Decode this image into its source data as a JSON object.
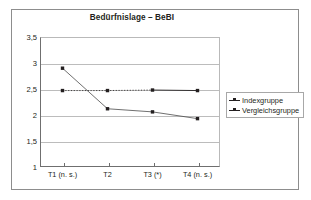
{
  "chart_data": {
    "type": "line",
    "title": "Bedürfnislage – BeBI",
    "xlabel": "",
    "ylabel": "",
    "categories": [
      "T1 (n. s.)",
      "T2",
      "T3 (*)",
      "T4 (n. s.)"
    ],
    "ylim": [
      1,
      3.5
    ],
    "yticks": [
      "1",
      "1,5",
      "2",
      "2,5",
      "3",
      "3,5"
    ],
    "ytick_values": [
      1,
      1.5,
      2,
      2.5,
      3,
      3.5
    ],
    "grid": true,
    "legend_position": "right",
    "series": [
      {
        "name": "Indexgruppe",
        "values": [
          2.9,
          2.12,
          2.06,
          1.93
        ],
        "color": "#231f20",
        "linestyle": "solid",
        "marker": "square"
      },
      {
        "name": "Vergleichsgruppe",
        "values": [
          2.47,
          2.47,
          2.48,
          2.47
        ],
        "color": "#231f20",
        "linestyle": "dotted-then-solid",
        "marker": "square"
      }
    ]
  },
  "chart": {
    "title": "Bedürfnislage – BeBI"
  },
  "legend": {
    "items": [
      {
        "label": "Indexgruppe"
      },
      {
        "label": "Vergleichsgruppe"
      }
    ]
  },
  "axis": {
    "y_labels": [
      "3,5",
      "3",
      "2,5",
      "2",
      "1,5",
      "1"
    ],
    "x_labels": [
      "T1 (n. s.)",
      "T2",
      "T3 (*)",
      "T4 (n. s.)"
    ]
  }
}
